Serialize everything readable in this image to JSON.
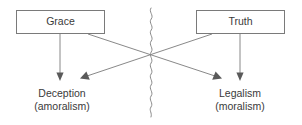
{
  "diagram": {
    "colors": {
      "box_stroke": "#7a7a7a",
      "line": "#7a7a7a",
      "divider": "#8a8a8a",
      "arrow_fill": "#5a5a5a",
      "text": "#3a3a3a",
      "background": "#ffffff"
    },
    "sources": [
      {
        "id": "grace",
        "label": "Grace"
      },
      {
        "id": "truth",
        "label": "Truth"
      }
    ],
    "outcomes": [
      {
        "id": "deception",
        "label": "Deception",
        "sublabel": "(amoralism)"
      },
      {
        "id": "legalism",
        "label": "Legalism",
        "sublabel": "(moralism)"
      }
    ],
    "divider": {
      "name": "wavy-divider",
      "orientation": "vertical"
    },
    "edges": [
      {
        "from": "grace",
        "to": "deception",
        "kind": "straight-down"
      },
      {
        "from": "grace",
        "to": "legalism",
        "kind": "diagonal-crossing"
      },
      {
        "from": "truth",
        "to": "legalism",
        "kind": "straight-down"
      },
      {
        "from": "truth",
        "to": "deception",
        "kind": "diagonal-crossing"
      }
    ]
  }
}
